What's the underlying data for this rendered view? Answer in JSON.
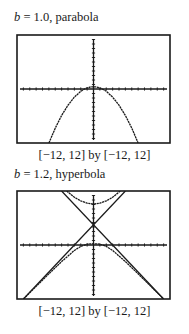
{
  "chart_data": [
    {
      "type": "line",
      "title": "b = 1.0, parabola",
      "title_var": "b",
      "title_rest": " = 1.0, parabola",
      "window_label": "[−12, 12] by [−12, 12]",
      "xlim": [
        -12,
        12
      ],
      "ylim": [
        -12,
        12
      ],
      "x_ticks_step": 1,
      "y_ticks_step": 1,
      "grid": false,
      "series": [
        {
          "name": "parabola",
          "x": [
            -7,
            -6,
            -5,
            -4,
            -3,
            -2,
            -1.4,
            -1,
            -0.5,
            0,
            0.5,
            1,
            1.4,
            2,
            3,
            4,
            5,
            6,
            7
          ],
          "y": [
            -12,
            -8.7,
            -5.9,
            -3.6,
            -1.8,
            -0.5,
            0,
            0.25,
            0.45,
            0.5,
            0.45,
            0.25,
            0,
            -0.5,
            -1.8,
            -3.6,
            -5.9,
            -8.7,
            -12
          ]
        }
      ],
      "frame": {
        "x": 17,
        "y": 35,
        "w": 153,
        "h": 108
      }
    },
    {
      "type": "line",
      "title": "b = 1.2, hyperbola",
      "title_var": "b",
      "title_rest": " = 1.2, hyperbola",
      "window_label": "[−12, 12] by [−12, 12]",
      "xlim": [
        -12,
        12
      ],
      "ylim": [
        -12,
        12
      ],
      "x_ticks_step": 1,
      "y_ticks_step": 1,
      "grid": false,
      "series": [
        {
          "name": "upper branch",
          "x": [
            -4.2,
            -3,
            -2,
            -1,
            0,
            1,
            2,
            3,
            4.2
          ],
          "y": [
            12,
            10.6,
            9.8,
            9.3,
            9.1,
            9.3,
            9.8,
            10.6,
            12
          ]
        },
        {
          "name": "lower branch",
          "x": [
            -11,
            -9,
            -7,
            -5,
            -3,
            -2,
            -1,
            0,
            1,
            2,
            3,
            5,
            7,
            9,
            11
          ],
          "y": [
            -12,
            -9.2,
            -6.4,
            -3.7,
            -1.2,
            -0.3,
            0.2,
            0.3,
            0.2,
            -0.3,
            -1.2,
            -3.7,
            -6.4,
            -9.2,
            -12
          ]
        },
        {
          "name": "asymptote left",
          "x": [
            -11,
            5
          ],
          "y": [
            -12,
            12
          ]
        },
        {
          "name": "asymptote right",
          "x": [
            -5,
            11
          ],
          "y": [
            12,
            -12
          ]
        }
      ],
      "frame": {
        "x": 17,
        "y": 191,
        "w": 153,
        "h": 108
      }
    }
  ],
  "colors": {
    "curve": "#1a1a1a",
    "frame": "#1a1a1a",
    "background": "#ffffff"
  }
}
